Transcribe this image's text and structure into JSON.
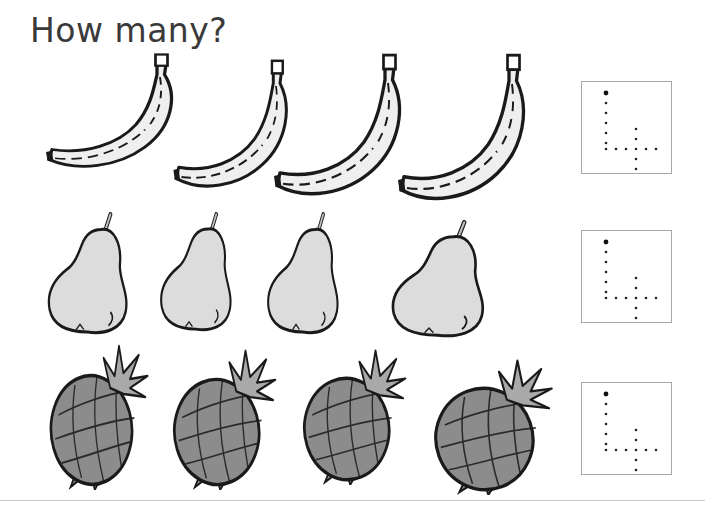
{
  "worksheet": {
    "title": "How many?",
    "rows": [
      {
        "fruit": "banana",
        "count": 4,
        "items": [
          {
            "x": 40,
            "y": 52,
            "w": 150,
            "h": 125
          },
          {
            "x": 168,
            "y": 58,
            "w": 135,
            "h": 140
          },
          {
            "x": 268,
            "y": 52,
            "w": 150,
            "h": 155
          },
          {
            "x": 392,
            "y": 52,
            "w": 150,
            "h": 160
          }
        ],
        "answer_box": {
          "x": 581,
          "y": 81,
          "digit": "4"
        }
      },
      {
        "fruit": "pear",
        "count": 4,
        "items": [
          {
            "x": 42,
            "y": 212,
            "w": 95,
            "h": 125
          },
          {
            "x": 155,
            "y": 212,
            "w": 85,
            "h": 122
          },
          {
            "x": 262,
            "y": 212,
            "w": 85,
            "h": 125
          },
          {
            "x": 385,
            "y": 220,
            "w": 110,
            "h": 120
          }
        ],
        "answer_box": {
          "x": 581,
          "y": 230,
          "digit": "4"
        }
      },
      {
        "fruit": "pineapple",
        "count": 4,
        "items": [
          {
            "x": 42,
            "y": 340,
            "w": 110,
            "h": 150
          },
          {
            "x": 165,
            "y": 345,
            "w": 115,
            "h": 145
          },
          {
            "x": 295,
            "y": 345,
            "w": 115,
            "h": 140
          },
          {
            "x": 425,
            "y": 355,
            "w": 132,
            "h": 140
          }
        ],
        "answer_box": {
          "x": 581,
          "y": 382,
          "digit": "4"
        }
      }
    ],
    "colors": {
      "banana_fill": "#efefef",
      "pear_fill": "#dcdcdc",
      "pineapple_fill": "#8c8c8c",
      "outline": "#1a1a1a",
      "box_border": "#a8a8a8",
      "title_color": "#3a3a3a"
    }
  }
}
